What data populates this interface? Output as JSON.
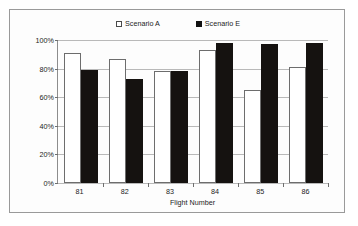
{
  "chart_data": {
    "type": "bar",
    "title": "",
    "xlabel": "Flight Number",
    "ylabel": "",
    "categories": [
      "81",
      "82",
      "83",
      "84",
      "85",
      "86"
    ],
    "ytick_labels": [
      "0%",
      "20%",
      "40%",
      "60%",
      "80%",
      "100%"
    ],
    "ytick_values": [
      0,
      20,
      40,
      60,
      80,
      100
    ],
    "ylim": [
      0,
      100
    ],
    "grid": true,
    "legend_position": "top-center",
    "series": [
      {
        "name": "Scenario A",
        "color": "#ffffff",
        "marker": "open-square",
        "values": [
          91,
          87,
          78,
          93,
          65,
          81
        ]
      },
      {
        "name": "Scenario E",
        "color": "#151210",
        "marker": "filled-square",
        "values": [
          79,
          73,
          78.5,
          98,
          97,
          98
        ]
      }
    ]
  },
  "legend": {
    "entries": [
      {
        "label": "Scenario A"
      },
      {
        "label": "Scenario E"
      }
    ]
  },
  "axes": {
    "x_title": "Flight Number"
  },
  "colors": {
    "series_a": "#ffffff",
    "series_e": "#151210",
    "gridline": "#b9b9b9",
    "axis": "#6e6e6e",
    "border": "#9a9a9a"
  }
}
